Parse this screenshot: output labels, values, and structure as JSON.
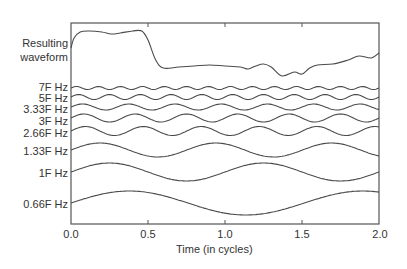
{
  "chart_data": {
    "type": "line",
    "title": "",
    "xlabel": "Time (in cycles)",
    "ylabel": "",
    "xlim": [
      0.0,
      2.0
    ],
    "x_ticks": [
      "0.0",
      "0.5",
      "1.0",
      "1.5",
      "2.0"
    ],
    "grid": false,
    "legend": "none (inline labels on left)",
    "series": [
      {
        "name": "Resulting waveform",
        "kind": "composite",
        "baseline_px": 45,
        "points": [
          [
            0.0,
            48
          ],
          [
            0.02,
            38
          ],
          [
            0.06,
            32
          ],
          [
            0.12,
            31
          ],
          [
            0.2,
            32
          ],
          [
            0.26,
            34
          ],
          [
            0.32,
            33
          ],
          [
            0.4,
            31
          ],
          [
            0.46,
            31
          ],
          [
            0.5,
            40
          ],
          [
            0.55,
            60
          ],
          [
            0.6,
            68
          ],
          [
            0.7,
            67
          ],
          [
            0.8,
            66
          ],
          [
            0.9,
            65
          ],
          [
            1.0,
            66
          ],
          [
            1.1,
            67
          ],
          [
            1.15,
            69
          ],
          [
            1.2,
            66
          ],
          [
            1.25,
            64
          ],
          [
            1.3,
            67
          ],
          [
            1.37,
            76
          ],
          [
            1.45,
            72
          ],
          [
            1.5,
            74
          ],
          [
            1.55,
            68
          ],
          [
            1.6,
            65
          ],
          [
            1.7,
            64
          ],
          [
            1.8,
            60
          ],
          [
            1.87,
            56
          ],
          [
            1.95,
            58
          ],
          [
            2.0,
            53
          ]
        ]
      },
      {
        "name": "7F Hz",
        "frequency_factor": 7,
        "amplitude_px": 1.5,
        "baseline_px": 88,
        "phase": 0
      },
      {
        "name": "5F Hz",
        "frequency_factor": 5,
        "amplitude_px": 2.5,
        "baseline_px": 97,
        "phase": 0
      },
      {
        "name": "3.33F Hz",
        "frequency_factor": 3.33,
        "amplitude_px": 3,
        "baseline_px": 107,
        "phase": 0
      },
      {
        "name": "3F Hz",
        "frequency_factor": 3,
        "amplitude_px": 4,
        "baseline_px": 118,
        "phase": 0
      },
      {
        "name": "2.66F Hz",
        "frequency_factor": 2.66,
        "amplitude_px": 4.5,
        "baseline_px": 131,
        "phase": 0
      },
      {
        "name": "1.33F Hz",
        "frequency_factor": 1.33,
        "amplitude_px": 7,
        "baseline_px": 150,
        "phase": 0
      },
      {
        "name": "1F Hz",
        "frequency_factor": 1,
        "amplitude_px": 9,
        "baseline_px": 172,
        "phase": 0
      },
      {
        "name": "0.66F Hz",
        "frequency_factor": 0.66,
        "amplitude_px": 12,
        "baseline_px": 203,
        "phase": 0
      }
    ]
  },
  "labels": {
    "resulting_line1": "Resulting",
    "resulting_line2": "waveform",
    "f7": "7F Hz",
    "f5": "5F Hz",
    "f333": "3.33F Hz",
    "f3": "3F Hz",
    "f266": "2.66F Hz",
    "f133": "1.33F Hz",
    "f1": "1F Hz",
    "f066": "0.66F Hz"
  },
  "axis": {
    "xlabel": "Time (in cycles)",
    "t0": "0.0",
    "t1": "0.5",
    "t2": "1.0",
    "t3": "1.5",
    "t4": "2.0"
  }
}
